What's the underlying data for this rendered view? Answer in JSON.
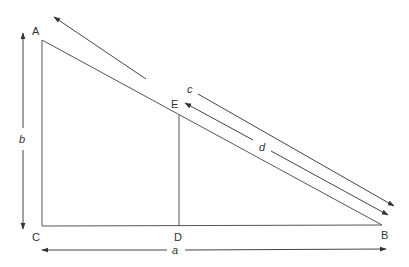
{
  "diagram": {
    "type": "right-triangle-similar-triangles",
    "colors": {
      "stroke": "#555555",
      "text": "#333333",
      "background": "#ffffff"
    },
    "points": {
      "A": {
        "label": "A",
        "x": 42,
        "y": 40
      },
      "B": {
        "label": "B",
        "x": 382,
        "y": 225
      },
      "C": {
        "label": "C",
        "x": 42,
        "y": 226
      },
      "D": {
        "label": "D",
        "x": 179,
        "y": 226
      },
      "E": {
        "label": "E",
        "x": 179,
        "y": 115
      }
    },
    "dimensions": {
      "a": {
        "label": "a",
        "from": "C",
        "to": "B"
      },
      "b": {
        "label": "b",
        "from": "A",
        "to": "C"
      },
      "c": {
        "label": "c",
        "from": "A",
        "to": "B"
      },
      "d": {
        "label": "d",
        "from": "E",
        "to": "B"
      }
    }
  }
}
